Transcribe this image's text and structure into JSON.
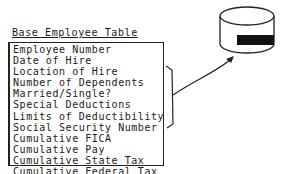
{
  "diagram": {
    "title": "Base Employee Table",
    "fields": [
      "Employee Number",
      "Date of Hire",
      "Location of Hire",
      "Number of Dependents",
      "Married/Single?",
      "Special Deductions",
      "Limits of Deductibility",
      "Social Security Number",
      "Cumulative FICA",
      "Cumulative Pay",
      "Cumulative State Tax",
      "Cumulative Federal Tax"
    ],
    "target": "database-cylinder"
  }
}
